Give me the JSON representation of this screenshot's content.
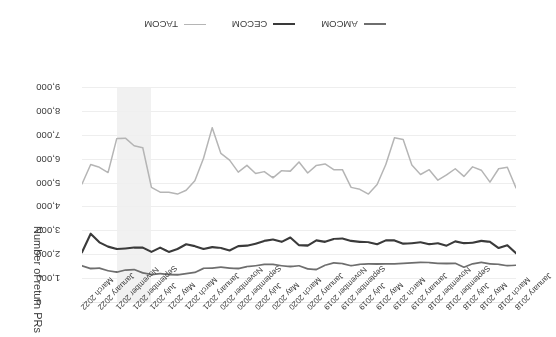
{
  "chart_data": {
    "type": "line",
    "title": "",
    "xlabel": "",
    "ylabel": "Number of return PRs",
    "ylim": [
      0,
      9000
    ],
    "y_inverted": false,
    "grid": true,
    "legend_position": "bottom",
    "rotation_degrees": 180,
    "y_ticks": [
      "0",
      "1,000",
      "2,000",
      "3,000",
      "4,000",
      "5,000",
      "6,000",
      "7,000",
      "8,000",
      "9,000"
    ],
    "y_tick_values": [
      0,
      1000,
      2000,
      3000,
      4000,
      5000,
      6000,
      7000,
      8000,
      9000
    ],
    "x_tick_labels": [
      "January 2018",
      "March 2018",
      "May 2018",
      "July 2018",
      "September 2018",
      "November 2018",
      "January 2019",
      "March 2019",
      "May 2019",
      "July 2019",
      "September 2019",
      "November 2019",
      "January 2020",
      "March 2020",
      "May 2020",
      "July 2020",
      "September 2020",
      "November 2020",
      "January 2021",
      "March 2021",
      "May 2021",
      "July 2021",
      "September 2021",
      "November 2021",
      "January 2022",
      "March 2022"
    ],
    "x": [
      "January 2018",
      "February 2018",
      "March 2018",
      "April 2018",
      "May 2018",
      "June 2018",
      "July 2018",
      "August 2018",
      "September 2018",
      "October 2018",
      "November 2018",
      "December 2018",
      "January 2019",
      "February 2019",
      "March 2019",
      "April 2019",
      "May 2019",
      "June 2019",
      "July 2019",
      "August 2019",
      "September 2019",
      "October 2019",
      "November 2019",
      "December 2019",
      "January 2020",
      "February 2020",
      "March 2020",
      "April 2020",
      "May 2020",
      "June 2020",
      "July 2020",
      "August 2020",
      "September 2020",
      "October 2020",
      "November 2020",
      "December 2020",
      "January 2021",
      "February 2021",
      "March 2021",
      "April 2021",
      "May 2021",
      "June 2021",
      "July 2021",
      "August 2021",
      "September 2021",
      "October 2021",
      "November 2021",
      "December 2021",
      "January 2022",
      "February 2022",
      "March 2022"
    ],
    "highlight_band": {
      "start": "July 2021",
      "end": "November 2021",
      "color": "#eeeeee"
    },
    "series": [
      {
        "name": "AMCOM",
        "color": "#6e6e6e",
        "values": [
          1580,
          1560,
          1620,
          1640,
          1700,
          1640,
          1500,
          1660,
          1650,
          1660,
          1690,
          1700,
          1680,
          1660,
          1640,
          1640,
          1630,
          1640,
          1620,
          1560,
          1650,
          1680,
          1580,
          1400,
          1430,
          1560,
          1520,
          1560,
          1620,
          1620,
          1560,
          1520,
          1440,
          1460,
          1500,
          1460,
          1450,
          1280,
          1230,
          1180,
          1190,
          1230,
          1190,
          1260,
          1400,
          1380,
          1290,
          1350,
          1460,
          1440,
          1560
        ]
      },
      {
        "name": "CECOM",
        "color": "#3a3a3a",
        "values": [
          2080,
          2420,
          2300,
          2560,
          2600,
          2520,
          2500,
          2580,
          2400,
          2500,
          2460,
          2540,
          2500,
          2480,
          2620,
          2620,
          2460,
          2540,
          2560,
          2600,
          2700,
          2680,
          2560,
          2620,
          2400,
          2420,
          2740,
          2560,
          2660,
          2600,
          2480,
          2400,
          2380,
          2200,
          2300,
          2340,
          2260,
          2380,
          2460,
          2260,
          2140,
          2320,
          2140,
          2320,
          2320,
          2280,
          2260,
          2360,
          2540,
          2900,
          2120
        ]
      },
      {
        "name": "TACOM",
        "color": "#b5b5b5",
        "values": [
          4820,
          5680,
          5620,
          5060,
          5560,
          5700,
          5300,
          5620,
          5360,
          5140,
          5580,
          5380,
          5780,
          6840,
          6920,
          5800,
          4960,
          4560,
          4760,
          4840,
          5580,
          5580,
          5820,
          5760,
          5440,
          5900,
          5520,
          5540,
          5240,
          5500,
          5420,
          5760,
          5480,
          5980,
          6260,
          7340,
          6060,
          5120,
          4720,
          4560,
          4640,
          4640,
          4840,
          6500,
          6580,
          6900,
          6880,
          5460,
          5680,
          5800,
          4980
        ]
      }
    ]
  },
  "legend": {
    "items": [
      {
        "label": "AMCOM",
        "color": "#6e6e6e",
        "width": 2
      },
      {
        "label": "CECOM",
        "color": "#3a3a3a",
        "width": 2.4
      },
      {
        "label": "TACOM",
        "color": "#b5b5b5",
        "width": 1.8
      }
    ]
  }
}
